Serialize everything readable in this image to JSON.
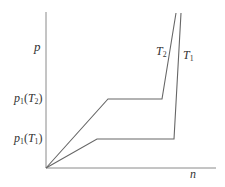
{
  "diagram": {
    "type": "p-n isotherm diagram",
    "axes": {
      "y_label": "p",
      "x_label": "n"
    },
    "ticks": [
      {
        "base": "p",
        "sub": "1",
        "arg_base": "T",
        "arg_sub": "2"
      },
      {
        "base": "p",
        "sub": "1",
        "arg_base": "T",
        "arg_sub": "1"
      }
    ],
    "curves": [
      {
        "name": "T2",
        "label_base": "T",
        "label_sub": "2"
      },
      {
        "name": "T1",
        "label_base": "T",
        "label_sub": "1"
      }
    ],
    "line_color": "#666666",
    "axis_color": "#8a8a8a"
  }
}
